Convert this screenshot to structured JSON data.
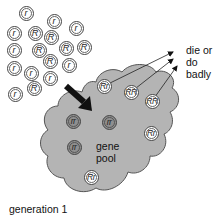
{
  "labels": {
    "outcome_line1": "die or",
    "outcome_line2": "do badly",
    "pool_line1": "gene",
    "pool_line2": "pool",
    "generation": "generation 1"
  },
  "colors": {
    "pool_fill": "#b4b4b4",
    "pool_stroke": "#555555",
    "arrow": "#111111",
    "homozygous_recessive_fill": "#8f8f8f"
  },
  "free_alleles": [
    {
      "label": "r",
      "x": 26,
      "y": 13
    },
    {
      "label": "r",
      "x": 54,
      "y": 21
    },
    {
      "label": "r",
      "x": 76,
      "y": 28
    },
    {
      "label": "r",
      "x": 14,
      "y": 33
    },
    {
      "label": "R",
      "x": 35,
      "y": 33
    },
    {
      "label": "R",
      "x": 51,
      "y": 37
    },
    {
      "label": "r",
      "x": 14,
      "y": 50
    },
    {
      "label": "R",
      "x": 39,
      "y": 50
    },
    {
      "label": "R",
      "x": 66,
      "y": 48
    },
    {
      "label": "R",
      "x": 84,
      "y": 47
    },
    {
      "label": "R",
      "x": 50,
      "y": 61
    },
    {
      "label": "r",
      "x": 69,
      "y": 65
    },
    {
      "label": "r",
      "x": 14,
      "y": 68
    },
    {
      "label": "r",
      "x": 31,
      "y": 73
    },
    {
      "label": "r",
      "x": 50,
      "y": 78
    },
    {
      "label": "R",
      "x": 34,
      "y": 88
    },
    {
      "label": "r",
      "x": 15,
      "y": 94
    }
  ],
  "pool_genotypes": [
    {
      "label": "Rr",
      "x": 104,
      "y": 86,
      "style": "light"
    },
    {
      "label": "RR",
      "x": 131,
      "y": 92,
      "style": "light"
    },
    {
      "label": "RR",
      "x": 152,
      "y": 101,
      "style": "light"
    },
    {
      "label": "rr",
      "x": 73,
      "y": 121,
      "style": "dark"
    },
    {
      "label": "rr",
      "x": 109,
      "y": 122,
      "style": "dark"
    },
    {
      "label": "rr",
      "x": 74,
      "y": 147,
      "style": "dark"
    },
    {
      "label": "Rr",
      "x": 151,
      "y": 133,
      "style": "light"
    },
    {
      "label": "Rr",
      "x": 91,
      "y": 177,
      "style": "light"
    }
  ]
}
